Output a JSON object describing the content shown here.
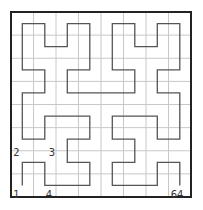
{
  "diagram": {
    "type": "hilbert-curve",
    "order": 3,
    "grid_size": 8,
    "colors": {
      "background": "#ffffff",
      "grid_line": "#c8c8c8",
      "border": "#222222",
      "curve": "#555555",
      "label": "#333333"
    },
    "labels": [
      {
        "text": "1",
        "cell": [
          0,
          0
        ],
        "pos": "below-left"
      },
      {
        "text": "2",
        "cell": [
          0,
          1
        ],
        "pos": "above-left"
      },
      {
        "text": "3",
        "cell": [
          1,
          1
        ],
        "pos": "above-right"
      },
      {
        "text": "4",
        "cell": [
          1,
          0
        ],
        "pos": "below-right"
      },
      {
        "text": "64",
        "cell": [
          7,
          0
        ],
        "pos": "below-right"
      }
    ],
    "path_cells": [
      [
        0,
        0
      ],
      [
        0,
        1
      ],
      [
        1,
        1
      ],
      [
        1,
        0
      ],
      [
        2,
        0
      ],
      [
        3,
        0
      ],
      [
        3,
        1
      ],
      [
        2,
        1
      ],
      [
        2,
        2
      ],
      [
        3,
        2
      ],
      [
        3,
        3
      ],
      [
        2,
        3
      ],
      [
        1,
        3
      ],
      [
        1,
        2
      ],
      [
        0,
        2
      ],
      [
        0,
        3
      ],
      [
        0,
        4
      ],
      [
        1,
        4
      ],
      [
        1,
        5
      ],
      [
        0,
        5
      ],
      [
        0,
        6
      ],
      [
        0,
        7
      ],
      [
        1,
        7
      ],
      [
        1,
        6
      ],
      [
        2,
        6
      ],
      [
        2,
        7
      ],
      [
        3,
        7
      ],
      [
        3,
        6
      ],
      [
        3,
        5
      ],
      [
        2,
        5
      ],
      [
        2,
        4
      ],
      [
        3,
        4
      ],
      [
        4,
        4
      ],
      [
        5,
        4
      ],
      [
        5,
        5
      ],
      [
        4,
        5
      ],
      [
        4,
        6
      ],
      [
        4,
        7
      ],
      [
        5,
        7
      ],
      [
        5,
        6
      ],
      [
        6,
        6
      ],
      [
        6,
        7
      ],
      [
        7,
        7
      ],
      [
        7,
        6
      ],
      [
        7,
        5
      ],
      [
        6,
        5
      ],
      [
        6,
        4
      ],
      [
        7,
        4
      ],
      [
        7,
        3
      ],
      [
        7,
        2
      ],
      [
        6,
        2
      ],
      [
        6,
        3
      ],
      [
        5,
        3
      ],
      [
        4,
        3
      ],
      [
        4,
        2
      ],
      [
        5,
        2
      ],
      [
        5,
        1
      ],
      [
        4,
        1
      ],
      [
        4,
        0
      ],
      [
        5,
        0
      ],
      [
        6,
        0
      ],
      [
        6,
        1
      ],
      [
        7,
        1
      ],
      [
        7,
        0
      ]
    ]
  }
}
